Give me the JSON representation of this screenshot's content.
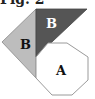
{
  "caption": "Fig. 2",
  "colors": {
    "dark_triangle": "#555555",
    "light_triangle": "#bdbdbd",
    "octagon_fill": "#ffffff",
    "outline": "#9a9a9a",
    "label_dark": "#111111",
    "label_light": "#ffffff"
  },
  "shapes": {
    "dark_triangle": {
      "label": "B",
      "points": "36,9 87,9 36,57"
    },
    "light_triangle": {
      "label": "B",
      "points": "36,9 2,42 36,78"
    },
    "octagon": {
      "label": "A",
      "points": "48,43 67,43 88,57 88,80 72,95 52,95 36,78 36,57"
    }
  }
}
